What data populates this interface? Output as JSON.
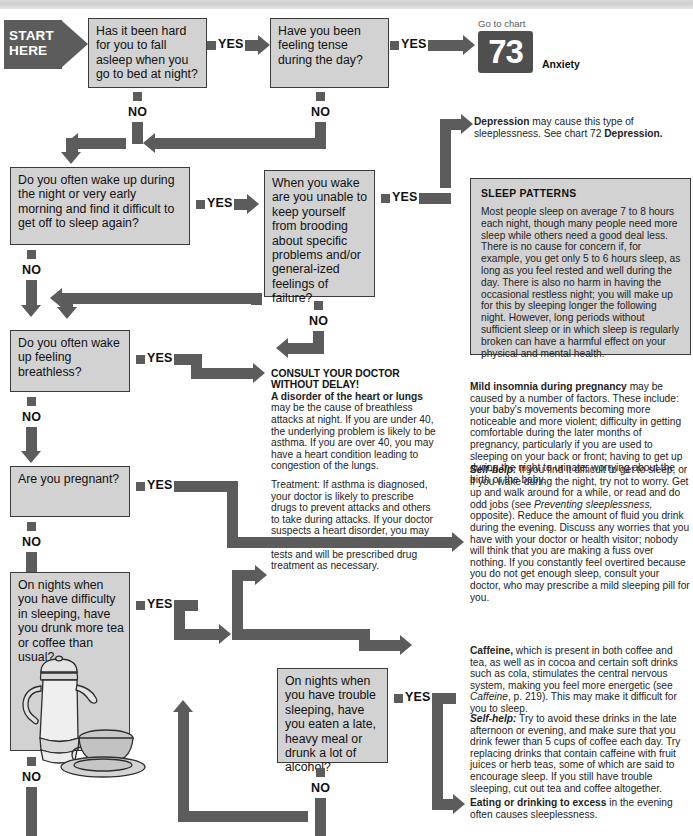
{
  "chart": {
    "start_label": "START\nHERE",
    "yes_label": "YES",
    "no_label": "NO"
  },
  "boxes": {
    "q1": "Has it been hard for you to fall asleep when you go to bed at night?",
    "q2": "Have you been feeling tense during the day?",
    "q3": "Do you often wake up during the night or very early morning and find it difficult to get off to sleep again?",
    "q4": "When you wake are you unable to keep yourself from brooding about specific problems and/or general-ized feelings of failure?",
    "q5": "Do you often wake up feeling breathless?",
    "q6": "Are you pregnant?",
    "q7": "On nights when you have difficulty in sleeping, have you drunk more tea or coffee than usual?",
    "q8": "On nights when you have trouble sleeping, have you eaten a late, heavy meal or drunk a lot of alcohol?"
  },
  "goto_chart": {
    "caption": "Go to chart",
    "number": "73",
    "name": "Anxiety"
  },
  "depression": {
    "lead": "Depression",
    "rest": " may cause this type of sleeplessness. See chart 72 ",
    "ref": "Depression."
  },
  "sleep_patterns": {
    "title": "SLEEP PATTERNS",
    "body": "Most people sleep on average 7 to 8 hours each night, though many people need more sleep while others need a good deal less. There is no cause for concern if, for example, you get only 5 to 6 hours sleep, as long as you feel rested and well during the day. There is also no harm in having the occasional restless night; you will make up for this by sleeping longer the following night. However, long periods without sufficient sleep or in which sleep is regularly broken can have a harmful effect on your physical and mental health."
  },
  "consult": {
    "heading": "CONSULT YOUR DOCTOR WITHOUT DELAY!",
    "lead": "A disorder of the heart or lungs",
    "body": " may be the cause of breathless attacks at night. If you are under 40, the underlying problem is likely to be asthma. If you are over 40, you may have a heart condition leading to congestion of the lungs.",
    "treatment_label": "Treatment:",
    "treatment_body": " If asthma is diagnosed, your doctor is likely to prescribe drugs to prevent attacks and others to take during attacks. If your doctor suspects a heart disorder, you may be referred to hospital for further tests and will be prescribed drug treatment as necessary."
  },
  "pregnancy": {
    "lead": "Mild insomnia during pregnancy",
    "body": " may be caused by a number of factors. These include: your baby's movements becoming more noticeable and more violent; difficulty in getting comfortable during the later months of pregnancy, particularly if you are used to sleeping on your back or front; having to get up during the night to urinate; worrying about the birth or the baby.",
    "selfhelp_label": "Self-help:",
    "selfhelp_1": " If you find it difficult to get to sleep, or if you wake during the night, try not to worry. Get up and walk around for a while, or read and do odd jobs (see ",
    "selfhelp_italic": "Preventing sleeplessness,",
    "selfhelp_2": " opposite). Reduce the amount of fluid you drink during the evening. Discuss any worries that you have with your doctor or health visitor; nobody will think that you are making a fuss over nothing. If you constantly feel overtired because you do not get enough sleep, consult your doctor, who may prescribe a mild sleeping pill for you."
  },
  "caffeine": {
    "lead": "Caffeine,",
    "body_1": " which is present in both coffee and tea, as well as in cocoa and certain soft drinks such as cola, stimulates the central nervous system, making you feel more energetic (see ",
    "italic_ref": "Caffeine",
    "body_2": ", p. 219). This may make it difficult for you to sleep.",
    "selfhelp_label": "Self-help:",
    "selfhelp_body": " Try to avoid these drinks in the late afternoon or evening, and make sure that you drink fewer than 5 cups of coffee each day. Try replacing drinks that contain caffeine with fruit juices or herb teas, some of which are said to encourage sleep. If you still have trouble sleeping, cut out tea and coffee altogether."
  },
  "eating": {
    "lead": "Eating or drinking to excess",
    "body": " in the evening often causes sleeplessness."
  },
  "colors": {
    "arrow": "#5c5c5c",
    "box_fill": "#d2d2d2",
    "box_border": "#3b3b3b",
    "badge": "#4f4f4f",
    "page": "#ffffff"
  }
}
